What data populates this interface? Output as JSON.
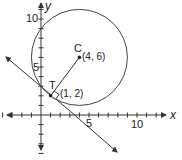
{
  "diagram": {
    "axes": {
      "x_label": "x",
      "y_label": "y",
      "x_tick_labels": [
        {
          "value": 5,
          "text": "5"
        },
        {
          "value": 10,
          "text": "10"
        }
      ],
      "y_tick_labels": [
        {
          "value": 5,
          "text": "5"
        },
        {
          "value": 10,
          "text": "10"
        }
      ],
      "x_range": [
        -4,
        12
      ],
      "y_range": [
        -4,
        11
      ]
    },
    "circle": {
      "center": [
        4,
        6
      ],
      "radius": 5
    },
    "points": {
      "center": {
        "name": "C",
        "coord_text": "(4, 6)",
        "x": 4,
        "y": 6
      },
      "tangent": {
        "name": "T",
        "coord_text": "(1, 2)",
        "x": 1,
        "y": 2
      }
    },
    "tangent_line": {
      "slope": -0.75,
      "through": [
        1,
        2
      ]
    },
    "colors": {
      "stroke": "#333333",
      "text": "#222222"
    }
  }
}
